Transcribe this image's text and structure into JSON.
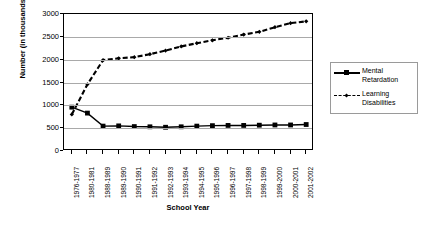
{
  "chart_data": {
    "type": "line",
    "title": "",
    "xlabel": "School Year",
    "ylabel": "Number (in thousands)",
    "ylim": [
      0,
      3000
    ],
    "ytick_values": [
      0,
      500,
      1000,
      1500,
      2000,
      2500,
      3000
    ],
    "ytick_labels": [
      "0",
      "500",
      "1000",
      "1500",
      "2000",
      "2500",
      "3000"
    ],
    "grid": true,
    "legend_position": "right",
    "categories": [
      "1976-1977",
      "1980-1981",
      "1988-1989",
      "1989-1990",
      "1990-1991",
      "1991-1992",
      "1992-1993",
      "1993-1994",
      "1994-1995",
      "1995-1996",
      "1996-1997",
      "1997-1998",
      "1998-1999",
      "1999-2000",
      "2000-2001",
      "2001-2002"
    ],
    "series": [
      {
        "name": "Mental Retardation",
        "marker": "square",
        "line_style": "solid",
        "color": "#000000",
        "values": [
          960,
          830,
          545,
          550,
          535,
          530,
          520,
          530,
          545,
          555,
          560,
          560,
          565,
          570,
          570,
          580
        ]
      },
      {
        "name": "Learning Disabilities",
        "marker": "diamond",
        "line_style": "dashed",
        "color": "#000000",
        "values": [
          800,
          1460,
          1990,
          2030,
          2055,
          2120,
          2200,
          2290,
          2360,
          2425,
          2480,
          2550,
          2610,
          2710,
          2800,
          2840
        ]
      }
    ]
  },
  "legend": {
    "items": [
      {
        "label_line1": "Mental",
        "label_line2": "Retardation"
      },
      {
        "label_line1": "Learning",
        "label_line2": "Disabilities"
      }
    ]
  }
}
